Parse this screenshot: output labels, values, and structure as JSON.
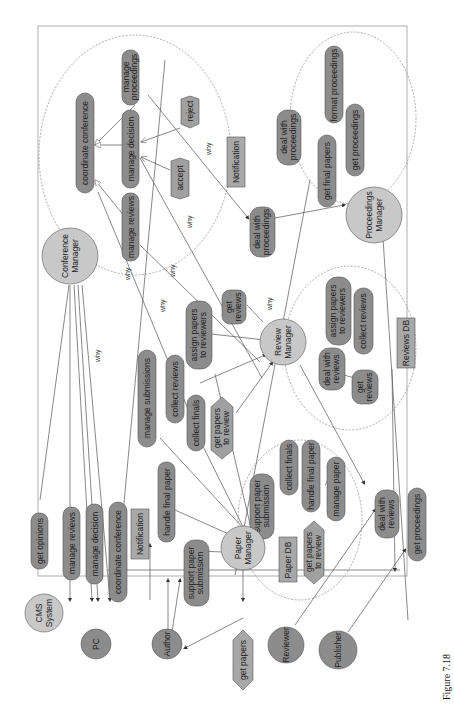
{
  "colors": {
    "goal_fill": "#8c8c8c",
    "actor_fill": "#c8c8c8",
    "agent_fill": "#8c8c8c",
    "resource_fill": "#a8a8a8",
    "task_fill": "#a0a0a0",
    "line": "#555555",
    "boundary": "#888888"
  },
  "caption": "Figure 7.18",
  "actors": {
    "cms_system": "CMS System",
    "conference_manager": "Conference Manager",
    "review_manager": "Review Manager",
    "proceedings_manager": "Proceedings Manager",
    "paper_manager": "Paper Manager",
    "pc": "PC",
    "author": "Author",
    "reviewer": "Reviewer",
    "publisher": "Publisher"
  },
  "conference_manager_boundary": {
    "goals": [
      "coordinate conference",
      "manage proceedings",
      "manage decision",
      "manage reviews"
    ],
    "tasks": [
      "reject",
      "accept"
    ]
  },
  "proceedings_manager_boundary": {
    "goals": [
      "deal with proceedings",
      "format proceedings",
      "get final papers",
      "get proceedings"
    ]
  },
  "review_manager_boundary": {
    "goals": [
      "assign papers to reviewers",
      "collect reviews",
      "deal with reviews",
      "get reviews"
    ],
    "resources": [
      "Reviews DB"
    ]
  },
  "paper_manager_boundary": {
    "goals": [
      "support paper submission",
      "collect finals",
      "handle final paper",
      "manage paper"
    ],
    "resources": [
      "Paper DB"
    ],
    "tasks": [
      "get papers to review"
    ]
  },
  "dependums": {
    "notification_cm": "Notification",
    "deal_with_proceedings": "deal with proceedings",
    "get_reviews": "get reviews",
    "assign_papers_to_reviewers": "assign papers to reviewers",
    "collect_reviews": "collect reviews",
    "collect_finals": "collect finals",
    "get_papers_to_review": "get papers to review",
    "manage_submissions": "manage submissions",
    "get_opinions": "get opinions",
    "manage_reviews": "manage reviews",
    "manage_decision": "manage decision",
    "coordinate_conference": "coordinate conference",
    "notification_author": "Notification",
    "handle_final_paper": "handle final paper",
    "support_paper_submission": "support paper submission",
    "get_papers": "get papers",
    "deal_with_reviews": "deal with reviews",
    "get_proceedings": "get proceedings"
  },
  "link_label": "why"
}
